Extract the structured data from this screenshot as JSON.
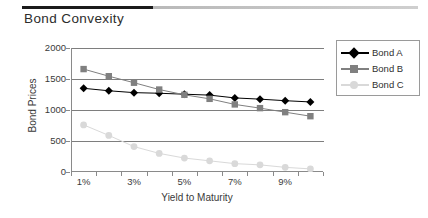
{
  "title": "Bond Convexity",
  "legend": {
    "position": "right",
    "entries": [
      {
        "label": "Bond A",
        "color": "#000000",
        "marker": "diamond"
      },
      {
        "label": "Bond B",
        "color": "#808080",
        "marker": "square"
      },
      {
        "label": "Bond C",
        "color": "#d9d9d9",
        "marker": "circle"
      }
    ]
  },
  "axes": {
    "ylabel": "Bond Prices",
    "xlabel": "Yield to Maturity",
    "yticks": [
      "0",
      "500",
      "1000",
      "1500",
      "2000"
    ],
    "xticks": [
      "1%",
      "",
      "3%",
      "",
      "5%",
      "",
      "7%",
      "",
      "9%",
      ""
    ]
  },
  "chart_data": {
    "type": "line",
    "title": "Bond Convexity",
    "xlabel": "Yield to Maturity",
    "ylabel": "Bond Prices",
    "categories": [
      "1%",
      "2%",
      "3%",
      "4%",
      "5%",
      "6%",
      "7%",
      "8%",
      "9%",
      "10%"
    ],
    "tick_labels_shown": [
      "1%",
      "3%",
      "5%",
      "7%",
      "9%"
    ],
    "ylim": [
      0,
      2000
    ],
    "yticks": [
      0,
      500,
      1000,
      1500,
      2000
    ],
    "grid": true,
    "legend_position": "right",
    "series": [
      {
        "name": "Bond A",
        "color": "#000000",
        "marker": "diamond",
        "values": [
          1350,
          1310,
          1280,
          1270,
          1255,
          1240,
          1195,
          1175,
          1150,
          1130
        ]
      },
      {
        "name": "Bond B",
        "color": "#808080",
        "marker": "square",
        "values": [
          1660,
          1545,
          1440,
          1330,
          1245,
          1180,
          1090,
          1030,
          965,
          900
        ]
      },
      {
        "name": "Bond C",
        "color": "#d9d9d9",
        "marker": "circle",
        "values": [
          760,
          590,
          410,
          300,
          225,
          180,
          135,
          115,
          75,
          50
        ]
      }
    ]
  }
}
